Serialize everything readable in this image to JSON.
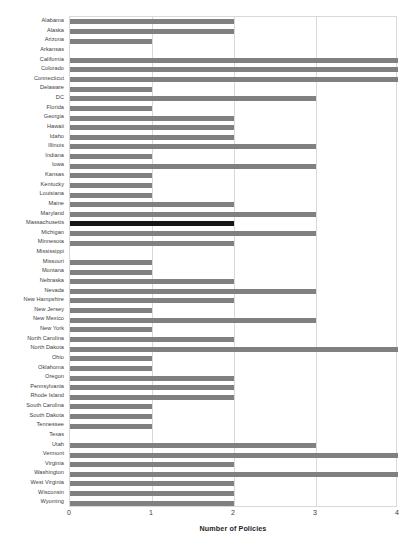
{
  "chart_data": {
    "type": "bar",
    "orientation": "horizontal",
    "title": "",
    "xlabel": "Number of Policies",
    "ylabel": "",
    "xlim": [
      0,
      4
    ],
    "xticks": [
      0,
      1,
      2,
      3,
      4
    ],
    "grid": true,
    "legend": false,
    "bar_color": "#808080",
    "highlight_color": "#161616",
    "highlight_category": "Massachusetts",
    "categories": [
      "Alabama",
      "Alaska",
      "Arizona",
      "Arkansas",
      "California",
      "Colorado",
      "Connecticut",
      "Delaware",
      "DC",
      "Florida",
      "Georgia",
      "Hawaii",
      "Idaho",
      "Illinois",
      "Indiana",
      "Iowa",
      "Kansas",
      "Kentucky",
      "Louisiana",
      "Maine",
      "Maryland",
      "Massachusetts",
      "Michigan",
      "Minnesota",
      "Mississippi",
      "Missouri",
      "Montana",
      "Nebraska",
      "Nevada",
      "New Hampshire",
      "New Jersey",
      "New Mexico",
      "New York",
      "North Carolina",
      "North Dakota",
      "Ohio",
      "Oklahoma",
      "Oregon",
      "Pennsylvania",
      "Rhode Island",
      "South Carolina",
      "South Dakota",
      "Tennessee",
      "Texas",
      "Utah",
      "Vermont",
      "Virginia",
      "Washington",
      "West Virginia",
      "Wisconsin",
      "Wyoming"
    ],
    "values": [
      2,
      2,
      1,
      0,
      4,
      4,
      4,
      1,
      3,
      1,
      2,
      2,
      2,
      3,
      1,
      3,
      1,
      1,
      1,
      2,
      3,
      2,
      3,
      2,
      0,
      1,
      1,
      2,
      3,
      2,
      1,
      3,
      1,
      2,
      4,
      1,
      1,
      2,
      2,
      2,
      1,
      1,
      1,
      0,
      3,
      4,
      2,
      4,
      2,
      2,
      2
    ]
  }
}
